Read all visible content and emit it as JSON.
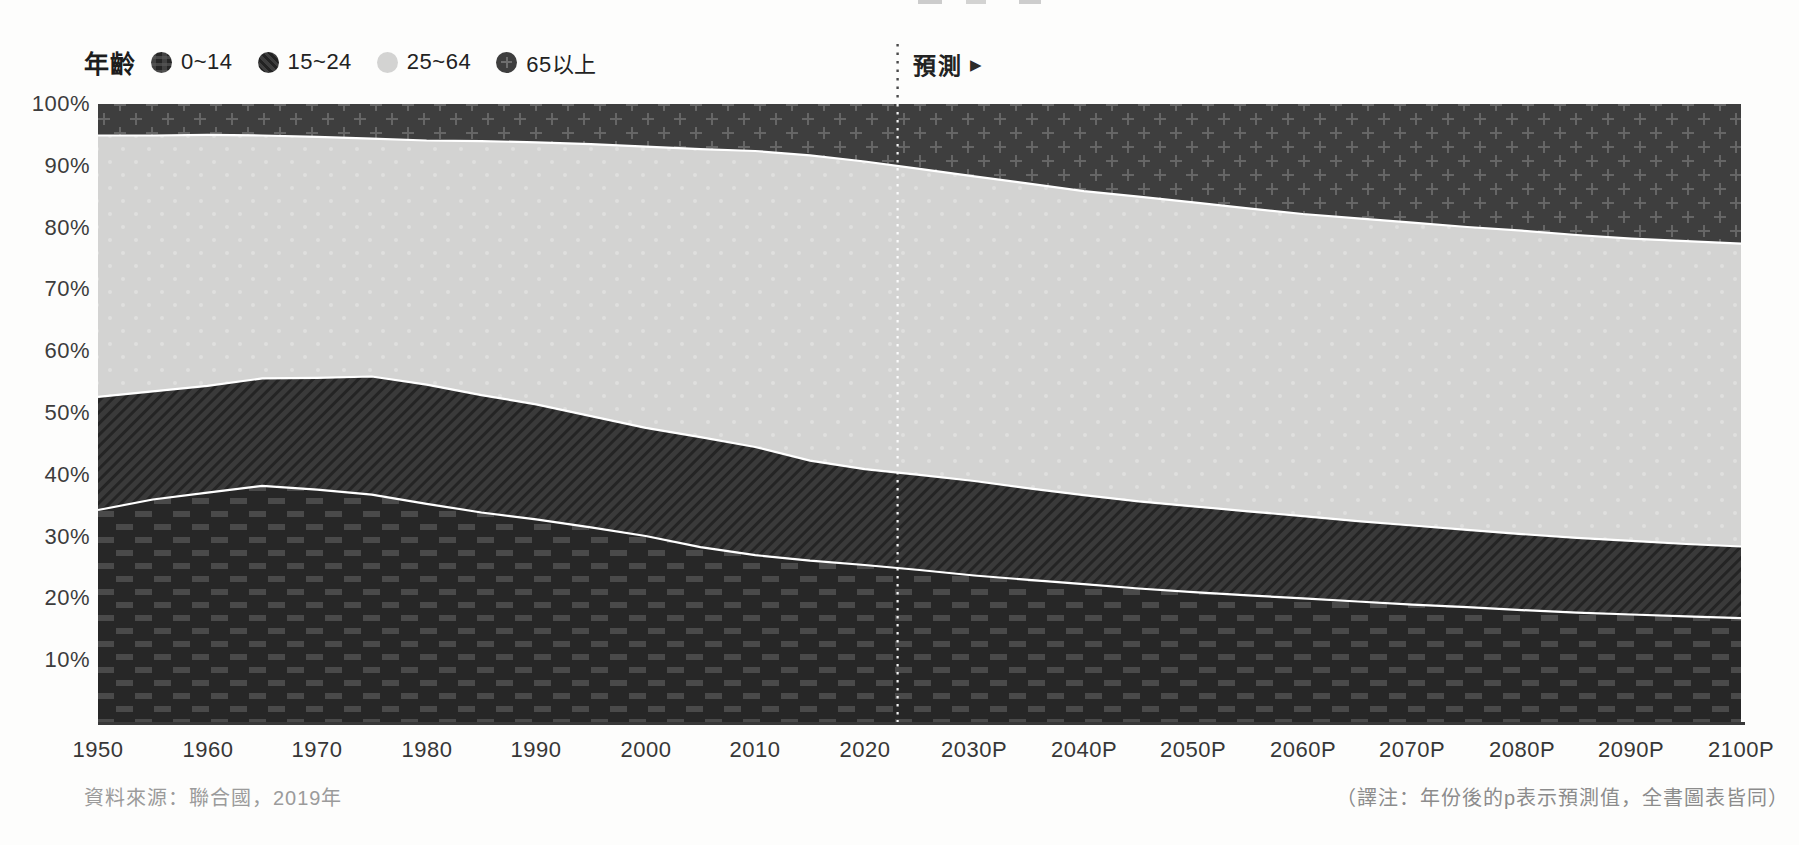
{
  "page": {
    "background": "#fdfdfc"
  },
  "legend": {
    "title": "年齡",
    "items": [
      {
        "label": "0~14",
        "swatch": "brick-weave-dark"
      },
      {
        "label": "15~24",
        "swatch": "diagonal-stripes-dark"
      },
      {
        "label": "25~64",
        "swatch": "plain-light-gray"
      },
      {
        "label": "65以上",
        "swatch": "cross-hatch-dark"
      }
    ]
  },
  "forecast": {
    "label": "預測",
    "arrow": "▶"
  },
  "notes": {
    "source": "資料來源：聯合國，2019年",
    "translator": "（譯注：年份後的p表示預測值，全書圖表皆同）"
  },
  "chart_data": {
    "type": "area",
    "stacked": true,
    "unit": "percent_of_total_population",
    "grid": false,
    "legend_position": "top-left",
    "x_range": [
      1950,
      2100
    ],
    "ylim": [
      0,
      100
    ],
    "forecast_divider_year": 2023,
    "x": [
      1950,
      1955,
      1960,
      1965,
      1970,
      1975,
      1980,
      1985,
      1990,
      1995,
      2000,
      2005,
      2010,
      2015,
      2020,
      2025,
      2030,
      2035,
      2040,
      2045,
      2050,
      2055,
      2060,
      2065,
      2070,
      2075,
      2080,
      2085,
      2090,
      2095,
      2100
    ],
    "series": [
      {
        "name": "0~14",
        "key": "age-0-14",
        "pattern": "p-0-14",
        "texture": "brick-weave",
        "values": [
          34.3,
          36.0,
          37.1,
          38.2,
          37.6,
          36.8,
          35.3,
          33.9,
          32.8,
          31.5,
          30.1,
          28.3,
          27.0,
          26.1,
          25.4,
          24.6,
          23.7,
          23.0,
          22.3,
          21.6,
          21.0,
          20.5,
          20.0,
          19.5,
          19.0,
          18.6,
          18.1,
          17.7,
          17.4,
          17.1,
          16.8
        ]
      },
      {
        "name": "15~24",
        "key": "age-15-24",
        "pattern": "p-15-24",
        "texture": "diagonal-stripes",
        "values": [
          18.3,
          17.5,
          17.3,
          17.4,
          18.1,
          19.1,
          19.3,
          19.0,
          18.6,
          18.0,
          17.5,
          17.8,
          17.5,
          16.2,
          15.5,
          15.4,
          15.3,
          14.8,
          14.4,
          14.1,
          13.9,
          13.6,
          13.3,
          13.0,
          12.8,
          12.5,
          12.3,
          12.1,
          11.9,
          11.7,
          11.6
        ]
      },
      {
        "name": "25~64",
        "key": "age-25-64",
        "pattern": "p-25-64",
        "texture": "plain-light",
        "values": [
          42.3,
          41.4,
          40.6,
          39.3,
          39.0,
          38.5,
          39.5,
          41.1,
          42.4,
          44.0,
          45.5,
          46.6,
          47.9,
          49.4,
          49.8,
          49.5,
          49.3,
          49.3,
          49.2,
          49.3,
          49.2,
          49.0,
          48.9,
          49.0,
          49.0,
          49.0,
          49.1,
          49.0,
          48.9,
          49.0,
          49.0
        ]
      },
      {
        "name": "65以上",
        "key": "age-65-plus",
        "pattern": "p-65",
        "texture": "cross-hatch",
        "values": [
          5.1,
          5.1,
          5.0,
          5.1,
          5.3,
          5.6,
          5.9,
          6.0,
          6.2,
          6.5,
          6.9,
          7.3,
          7.6,
          8.3,
          9.3,
          10.5,
          11.7,
          12.9,
          14.1,
          15.0,
          15.9,
          16.9,
          17.8,
          18.5,
          19.2,
          19.9,
          20.5,
          21.2,
          21.8,
          22.2,
          22.6
        ]
      }
    ],
    "y_ticks": [
      {
        "value": 100,
        "label": "100%"
      },
      {
        "value": 90,
        "label": "90%"
      },
      {
        "value": 80,
        "label": "80%"
      },
      {
        "value": 70,
        "label": "70%"
      },
      {
        "value": 60,
        "label": "60%"
      },
      {
        "value": 50,
        "label": "50%"
      },
      {
        "value": 40,
        "label": "40%"
      },
      {
        "value": 30,
        "label": "30%"
      },
      {
        "value": 20,
        "label": "20%"
      },
      {
        "value": 10,
        "label": "10%"
      }
    ],
    "x_ticks": [
      {
        "year": 1950,
        "label": "1950"
      },
      {
        "year": 1960,
        "label": "1960"
      },
      {
        "year": 1970,
        "label": "1970"
      },
      {
        "year": 1980,
        "label": "1980"
      },
      {
        "year": 1990,
        "label": "1990"
      },
      {
        "year": 2000,
        "label": "2000"
      },
      {
        "year": 2010,
        "label": "2010"
      },
      {
        "year": 2020,
        "label": "2020"
      },
      {
        "year": 2030,
        "label": "2030P"
      },
      {
        "year": 2040,
        "label": "2040P"
      },
      {
        "year": 2050,
        "label": "2050P"
      },
      {
        "year": 2060,
        "label": "2060P"
      },
      {
        "year": 2070,
        "label": "2070P"
      },
      {
        "year": 2080,
        "label": "2080P"
      },
      {
        "year": 2090,
        "label": "2090P"
      },
      {
        "year": 2100,
        "label": "2100P"
      }
    ],
    "colors": {
      "age_0_14_base": "#272727",
      "age_0_14_weave": "#4a4a4a",
      "age_15_24_base": "#3a3a3a",
      "age_15_24_stripe": "#242424",
      "age_25_64_base": "#d3d3d2",
      "age_25_64_dot": "#dfdfde",
      "age_65_base": "#3e3e3e",
      "age_65_cross": "#666666",
      "boundary_line": "#ffffff",
      "axis_line": "#383838",
      "forecast_line_top": "#4a4a4a",
      "forecast_line_chart": "#ffffff",
      "axis_text": "#3c3c3c",
      "note_text": "#9b9b9b"
    }
  }
}
